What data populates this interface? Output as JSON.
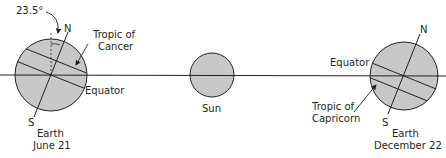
{
  "diagram": {
    "colors": {
      "body_fill": "#c8c8c8",
      "stroke": "#231f20",
      "background": "#ffffff"
    },
    "orbit_line": {
      "y": 75
    },
    "left_earth": {
      "angle_label": "23.5°",
      "north_label": "N",
      "south_label": "S",
      "tropic_label_line1": "Tropic of",
      "tropic_label_line2": "Cancer",
      "equator_label": "Equator",
      "name": "Earth",
      "date": "June 21"
    },
    "sun": {
      "label": "Sun"
    },
    "right_earth": {
      "north_label": "N",
      "south_label": "S",
      "equator_label": "Equator",
      "tropic_label_line1": "Tropic of",
      "tropic_label_line2": "Capricorn",
      "name": "Earth",
      "date": "December 22"
    }
  }
}
